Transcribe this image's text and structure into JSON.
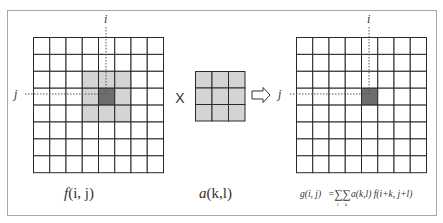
{
  "diagram": {
    "colors": {
      "frame": "#a8a8a8",
      "grid_line": "#2a2a2a",
      "cell_fill": "#ffffff",
      "neighborhood_fill": "#d4d4d4",
      "center_fill": "#6e6e6e",
      "kernel_fill": "#d4d4d4",
      "guide_line": "#555555",
      "text": "#333333"
    },
    "input_grid": {
      "label": "f(i, j)",
      "label_func": "f",
      "label_args": "(i, j)",
      "rows": 8,
      "cols": 8,
      "neighborhood": {
        "row_start": 2,
        "col_start": 3,
        "size": 3
      },
      "center": {
        "row": 3,
        "col": 4
      },
      "axis_i_label": "i",
      "axis_j_label": "j"
    },
    "operator": "X",
    "kernel": {
      "label": "a(k, l)",
      "label_func": "a",
      "label_args": "(k,l)",
      "rows": 3,
      "cols": 3
    },
    "arrow": "⇨",
    "output_grid": {
      "rows": 8,
      "cols": 8,
      "center": {
        "row": 3,
        "col": 4
      },
      "axis_i_label": "i",
      "axis_j_label": "j"
    },
    "formula": {
      "lhs": "g(i, j)",
      "equals": "=",
      "sum_outer": "∑",
      "sum_outer_index": "l",
      "sum_inner": "∑",
      "sum_inner_index": "k",
      "rhs": "a(k,l) f(i+k, j+l)"
    }
  }
}
